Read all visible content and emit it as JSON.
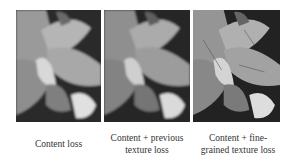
{
  "figure": {
    "panels": [
      {
        "id": "content-loss",
        "image_desc": "grayscale plant leaves close-up",
        "caption_lines": [
          "Content loss"
        ],
        "blur": 1.1
      },
      {
        "id": "content-previous-texture",
        "image_desc": "grayscale plant leaves close-up",
        "caption_lines": [
          "Content + previous",
          "texture loss"
        ],
        "blur": 0.8
      },
      {
        "id": "content-fine-grained-texture",
        "image_desc": "grayscale plant leaves close-up",
        "caption_lines": [
          "Content + fine-",
          "grained texture loss"
        ],
        "blur": 0.3
      }
    ]
  }
}
